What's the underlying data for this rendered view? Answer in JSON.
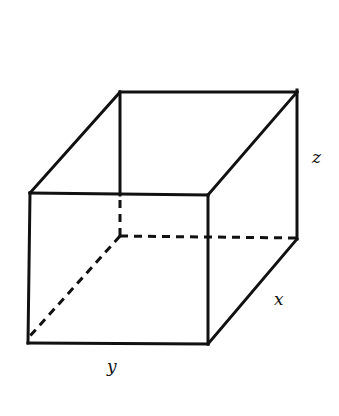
{
  "diagram": {
    "type": "rectangular-box",
    "labels": {
      "x": "x",
      "y": "y",
      "z": "z"
    },
    "stroke_color": "#111111",
    "background": "#ffffff"
  }
}
